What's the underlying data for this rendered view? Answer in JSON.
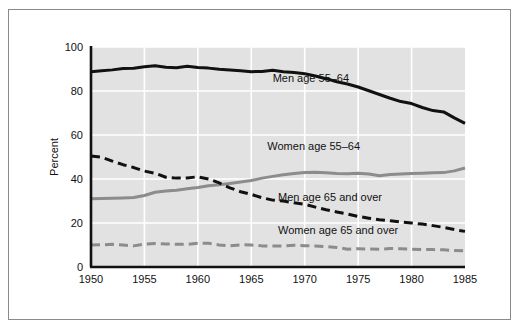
{
  "chart_data": {
    "type": "line",
    "title": "",
    "xlabel": "",
    "ylabel": "Percent",
    "xlim": [
      1950,
      1985
    ],
    "ylim": [
      0,
      100
    ],
    "grid": true,
    "legend_position": "inline-annotations",
    "x_ticks": [
      "1950",
      "1955",
      "1960",
      "1965",
      "1970",
      "1975",
      "1980",
      "1985"
    ],
    "y_ticks": [
      "0",
      "20",
      "40",
      "60",
      "80",
      "100"
    ],
    "x": [
      1950,
      1951,
      1952,
      1953,
      1954,
      1955,
      1956,
      1957,
      1958,
      1959,
      1960,
      1961,
      1962,
      1963,
      1964,
      1965,
      1966,
      1967,
      1968,
      1969,
      1970,
      1971,
      1972,
      1973,
      1974,
      1975,
      1976,
      1977,
      1978,
      1979,
      1980,
      1981,
      1982,
      1983,
      1984,
      1985
    ],
    "series": [
      {
        "name": "Men age 55-64",
        "label": "Men age 55–64",
        "color": "#111111",
        "style": "solid",
        "width": 3,
        "label_x": 1967.0,
        "label_y": 84,
        "values": [
          88.8,
          89.2,
          89.6,
          90.2,
          90.3,
          91.0,
          91.5,
          90.8,
          90.6,
          91.2,
          90.7,
          90.4,
          89.9,
          89.6,
          89.2,
          88.8,
          88.9,
          89.4,
          88.8,
          88.4,
          87.8,
          86.8,
          85.6,
          84.2,
          83.2,
          81.8,
          80.1,
          78.4,
          76.7,
          75.2,
          74.3,
          72.5,
          71.1,
          70.5,
          67.8,
          65.3
        ]
      },
      {
        "name": "Women age 55-64",
        "label": "Women age 55–64",
        "color": "#8c8c8c",
        "style": "solid",
        "width": 3,
        "label_x": 1966.5,
        "label_y": 53,
        "values": [
          31.0,
          31.1,
          31.2,
          31.4,
          31.6,
          32.5,
          34.0,
          34.5,
          34.9,
          35.6,
          36.1,
          36.9,
          37.4,
          38.0,
          38.6,
          39.3,
          40.4,
          41.2,
          41.9,
          42.5,
          43.0,
          43.1,
          42.8,
          42.5,
          42.4,
          42.6,
          42.3,
          41.5,
          42.0,
          42.3,
          42.5,
          42.6,
          42.8,
          42.9,
          43.7,
          45.0
        ]
      },
      {
        "name": "Men age 65 and over",
        "label": "Men age 65 and over",
        "color": "#111111",
        "style": "dashed",
        "width": 3,
        "label_x": 1967.5,
        "label_y": 30,
        "values": [
          50.5,
          49.9,
          48.1,
          46.5,
          45.2,
          43.6,
          42.6,
          40.8,
          40.4,
          40.5,
          41.0,
          40.0,
          38.2,
          36.0,
          34.2,
          33.0,
          31.5,
          30.4,
          30.0,
          29.2,
          28.5,
          27.2,
          26.0,
          25.0,
          24.1,
          23.0,
          22.2,
          21.5,
          21.0,
          20.5,
          20.0,
          19.5,
          18.8,
          18.0,
          17.0,
          16.2
        ]
      },
      {
        "name": "Women age 65 and over",
        "label": "Women age 65 and over",
        "color": "#8c8c8c",
        "style": "dashed",
        "width": 3,
        "label_x": 1967.5,
        "label_y": 15,
        "values": [
          10.0,
          10.1,
          10.3,
          10.0,
          9.6,
          10.4,
          10.7,
          10.5,
          10.3,
          10.3,
          10.8,
          10.8,
          10.0,
          9.6,
          10.1,
          10.0,
          9.6,
          9.6,
          9.6,
          9.9,
          9.7,
          9.5,
          9.3,
          8.9,
          8.1,
          8.3,
          8.2,
          8.1,
          8.4,
          8.3,
          8.1,
          8.0,
          7.9,
          7.8,
          7.5,
          7.3
        ]
      }
    ]
  }
}
